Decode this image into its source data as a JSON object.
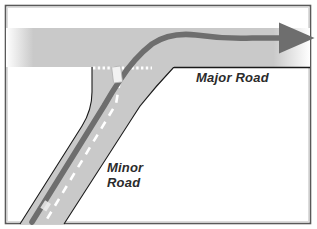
{
  "figure": {
    "frame_color": "#595959",
    "background": "#ffffff"
  },
  "labels": {
    "major_road": "Major Road",
    "minor_road_line1": "Minor",
    "minor_road_line2": "Road"
  },
  "colors": {
    "road_fill": "#c9c9c9",
    "road_edge": "#1a1a1a",
    "lane_marking": "#ffffff",
    "vehicle_path": "#6e6e6e",
    "give_way_marking": "#ffffff",
    "vehicle_body": "#f2f2f2",
    "label_text": "#2b2b2b"
  },
  "elements": {
    "major_road_band": "horizontal road band fading to white at both ends",
    "minor_road_band": "diagonal road band joining major road from lower left",
    "vehicle_path_arrow": "dark grey arrow showing path from minor road turning right onto major road",
    "give_way_line": "dotted white give-way marking across minor road at junction",
    "vehicle": "small light rectangle on minor road at the give-way line",
    "major_centre_line": "white dashed centre line on major road",
    "minor_centre_line": "white dashed centre line on minor road"
  }
}
